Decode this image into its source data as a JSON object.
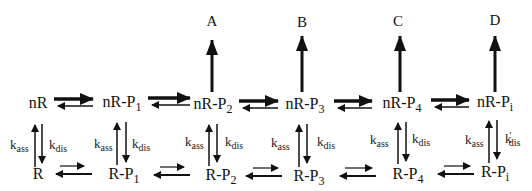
{
  "diagram": {
    "products": [
      "A",
      "B",
      "C",
      "D"
    ],
    "top_row": [
      {
        "base": "nR",
        "sub": ""
      },
      {
        "base": "nR-P",
        "sub": "1"
      },
      {
        "base": "nR-P",
        "sub": "2"
      },
      {
        "base": "nR-P",
        "sub": "3"
      },
      {
        "base": "nR-P",
        "sub": "4"
      },
      {
        "base": "nR-P",
        "sub": "i"
      }
    ],
    "bottom_row": [
      {
        "base": "R",
        "sub": ""
      },
      {
        "base": "R-P",
        "sub": "1"
      },
      {
        "base": "R-P",
        "sub": "2"
      },
      {
        "base": "R-P",
        "sub": "3"
      },
      {
        "base": "R-P",
        "sub": "4"
      },
      {
        "base": "R-P",
        "sub": "i"
      }
    ],
    "rate_labels": {
      "k": "k",
      "ass": "ass",
      "dis": "dis",
      "dis_prime": "′"
    },
    "colors": {
      "ink": "#111111",
      "background": "#ffffff"
    }
  }
}
